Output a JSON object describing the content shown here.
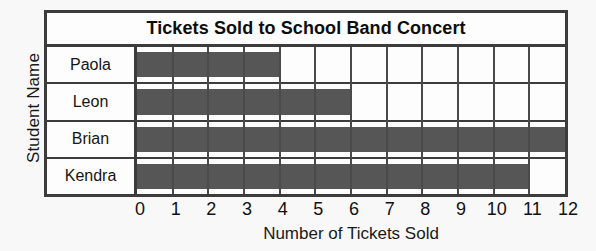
{
  "chart_data": {
    "type": "bar",
    "orientation": "horizontal",
    "title": "Tickets Sold to School Band Concert",
    "xlabel": "Number of Tickets Sold",
    "ylabel": "Student Name",
    "categories": [
      "Paola",
      "Leon",
      "Brian",
      "Kendra"
    ],
    "values": [
      4,
      6,
      12,
      11
    ],
    "xlim": [
      0,
      12
    ],
    "xticks": [
      0,
      1,
      2,
      3,
      4,
      5,
      6,
      7,
      8,
      9,
      10,
      11,
      12
    ],
    "xtick_labels": [
      "0",
      "1",
      "2",
      "3",
      "4",
      "5",
      "6",
      "7",
      "8",
      "9",
      "10",
      "11",
      "12"
    ],
    "grid": true,
    "grid_axis": "x",
    "legend": false,
    "bar_color": "#565656",
    "frame_color": "#3c3c3c",
    "background_color": "#fdfdfd",
    "page_background_color": "#f8f8f8",
    "text_color": "#111111"
  }
}
